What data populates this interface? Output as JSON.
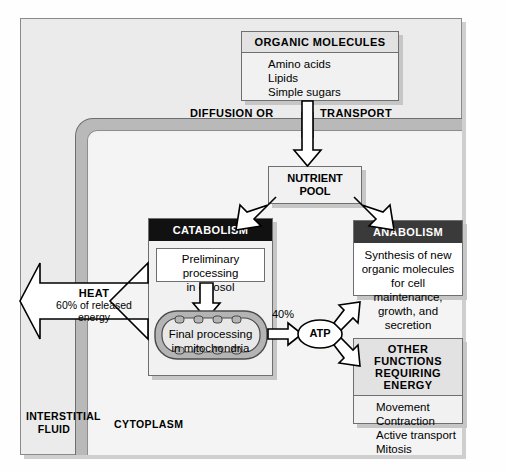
{
  "diagram": {
    "compartments": {
      "interstitial_fluid": "INTERSTITIAL\nFLUID",
      "interstitial_fluid_line1": "INTERSTITIAL",
      "interstitial_fluid_line2": "FLUID",
      "cytoplasm": "CYTOPLASM"
    },
    "organic_molecules": {
      "header": "ORGANIC MOLECULES",
      "items": [
        "Amino acids",
        "Lipids",
        "Simple sugars"
      ]
    },
    "membrane_crossing": {
      "left_label": "DIFFUSION OR",
      "right_label": "TRANSPORT"
    },
    "nutrient_pool": {
      "line1": "NUTRIENT",
      "line2": "POOL"
    },
    "catabolism": {
      "header": "CATABOLISM",
      "cytosol_step_line1": "Preliminary processing",
      "cytosol_step_line2": "in cytosol",
      "mito_step_line1": "Final processing",
      "mito_step_line2": "in mitochondria"
    },
    "anabolism": {
      "header": "ANABOLISM",
      "line1": "Synthesis of new",
      "line2": "organic molecules",
      "line3": "for cell maintenance,",
      "line4": "growth, and secretion"
    },
    "other_functions": {
      "header_line1": "OTHER FUNCTIONS",
      "header_line2": "REQUIRING ENERGY",
      "items": [
        "Movement",
        "Contraction",
        "Active transport",
        "Mitosis"
      ]
    },
    "atp": {
      "label": "ATP"
    },
    "energy_split": {
      "to_atp_percent": "40%",
      "heat_label": "HEAT",
      "heat_line1": "60% of released",
      "heat_line2": "energy"
    },
    "colors": {
      "page_background": "#fefefe",
      "frame_background": "#ebebeb",
      "cytosol_background": "#f4f4f4",
      "membrane": "#b9b9b9",
      "catabolism_header": "#111111",
      "anabolism_header": "#3a3a3a",
      "other_functions_header": "#e2e2e2",
      "box_border": "#6f6f6f",
      "arrow_fill": "#ffffff",
      "arrow_stroke": "#000000"
    }
  }
}
